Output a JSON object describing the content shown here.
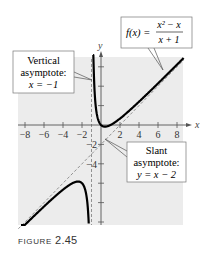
{
  "chart_data": {
    "type": "line",
    "title": "",
    "function_label": "f(x) = (x^2 - x)/(x + 1)",
    "function_label_parts": {
      "lhs": "f(x) =",
      "numerator": "x² − x",
      "denominator": "x + 1"
    },
    "xlabel": "x",
    "ylabel": "y",
    "xlim": [
      -8.7,
      8.7
    ],
    "ylim": [
      -10.5,
      7.0
    ],
    "x_ticks": [
      -8,
      -6,
      -4,
      -2,
      2,
      4,
      6,
      8
    ],
    "x_tick_labels": [
      "−8",
      "−6",
      "−4",
      "−2",
      "2",
      "4",
      "6",
      "8"
    ],
    "y_ticks": [
      -10,
      -8,
      -6,
      -4,
      -2,
      2,
      4,
      6
    ],
    "y_tick_labels_shown": {
      "-2": "−2",
      "-4": "−4"
    },
    "grid": false,
    "series": [
      {
        "name": "f(x) = (x^2 - x)/(x + 1)",
        "style": "solid-thick",
        "color": "#000000",
        "branches": [
          {
            "x_from": -8.7,
            "x_to": -1.14
          },
          {
            "x_from": -0.87,
            "x_to": 8.7
          }
        ]
      },
      {
        "name": "Vertical asymptote x = -1",
        "style": "dashed",
        "color": "#888888",
        "x": -1
      },
      {
        "name": "Slant asymptote y = x - 2",
        "style": "dashed",
        "color": "#888888",
        "slope": 1,
        "intercept": -2
      }
    ],
    "annotations": [
      {
        "id": "vertical",
        "lines": [
          "Vertical",
          "asymptote:",
          "x = −1"
        ]
      },
      {
        "id": "slant",
        "lines": [
          "Slant",
          "asymptote:",
          "y = x − 2"
        ]
      }
    ],
    "plot_background": "#ececec"
  },
  "caption": {
    "word": "FIGURE",
    "number": "2.45"
  }
}
